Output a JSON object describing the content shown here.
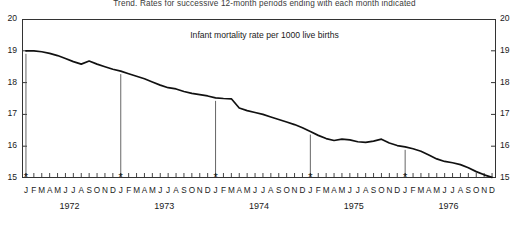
{
  "chart_data": {
    "type": "line",
    "title": "Trend.  Rates for successive 12-month periods ending with each month indicated",
    "subtitle": "Infant mortality rate per 1000 live births",
    "xlabel": "",
    "ylabel": "",
    "ylim": [
      15,
      20
    ],
    "yticks": [
      15,
      16,
      17,
      18,
      19,
      20
    ],
    "ytick_labels": [
      "15",
      "16",
      "17",
      "18",
      "19",
      "20"
    ],
    "right_axis": true,
    "grid": false,
    "legend": null,
    "years": [
      "1972",
      "1973",
      "1974",
      "1975",
      "1976"
    ],
    "month_labels": [
      "J",
      "F",
      "M",
      "A",
      "M",
      "J",
      "J",
      "A",
      "S",
      "O",
      "N",
      "D"
    ],
    "x_tick_labels": [
      "J",
      "F",
      "M",
      "A",
      "M",
      "J",
      "J",
      "A",
      "S",
      "O",
      "N",
      "D",
      "J",
      "F",
      "M",
      "A",
      "M",
      "J",
      "J",
      "A",
      "S",
      "O",
      "N",
      "D",
      "J",
      "F",
      "M",
      "A",
      "M",
      "J",
      "J",
      "A",
      "S",
      "O",
      "N",
      "D",
      "J",
      "F",
      "M",
      "A",
      "M",
      "J",
      "J",
      "A",
      "S",
      "O",
      "N",
      "D",
      "J",
      "F",
      "M",
      "A",
      "M",
      "J",
      "J",
      "A",
      "S",
      "O",
      "N",
      "D"
    ],
    "annotations": [
      {
        "label": "*",
        "x_index": 0,
        "note": "year marker"
      },
      {
        "label": "*",
        "x_index": 12,
        "note": "year marker"
      },
      {
        "label": "*",
        "x_index": 24,
        "note": "year marker"
      },
      {
        "label": "*",
        "x_index": 36,
        "note": "year marker"
      },
      {
        "label": "*",
        "x_index": 48,
        "note": "year marker"
      }
    ],
    "series": [
      {
        "name": "Infant mortality rate per 1000 live births",
        "color": "#111111",
        "x": [
          "1972-J",
          "1972-F",
          "1972-M",
          "1972-A",
          "1972-M",
          "1972-J",
          "1972-J",
          "1972-A",
          "1972-S",
          "1972-O",
          "1972-N",
          "1972-D",
          "1973-J",
          "1973-F",
          "1973-M",
          "1973-A",
          "1973-M",
          "1973-J",
          "1973-J",
          "1973-A",
          "1973-S",
          "1973-O",
          "1973-N",
          "1973-D",
          "1974-J",
          "1974-F",
          "1974-M",
          "1974-A",
          "1974-M",
          "1974-J",
          "1974-J",
          "1974-A",
          "1974-S",
          "1974-O",
          "1974-N",
          "1974-D",
          "1975-J",
          "1975-F",
          "1975-M",
          "1975-A",
          "1975-M",
          "1975-J",
          "1975-J",
          "1975-A",
          "1975-S",
          "1975-O",
          "1975-N",
          "1975-D",
          "1976-J",
          "1976-F",
          "1976-M",
          "1976-A",
          "1976-M",
          "1976-J",
          "1976-J",
          "1976-A",
          "1976-S",
          "1976-O",
          "1976-N",
          "1976-D"
        ],
        "values": [
          19.0,
          19.0,
          18.97,
          18.92,
          18.85,
          18.76,
          18.66,
          18.58,
          18.68,
          18.58,
          18.5,
          18.42,
          18.36,
          18.28,
          18.2,
          18.12,
          18.02,
          17.92,
          17.84,
          17.8,
          17.72,
          17.66,
          17.62,
          17.58,
          17.52,
          17.5,
          17.49,
          17.2,
          17.12,
          17.06,
          17.0,
          16.92,
          16.84,
          16.76,
          16.68,
          16.58,
          16.46,
          16.34,
          16.24,
          16.18,
          16.22,
          16.2,
          16.14,
          16.12,
          16.16,
          16.22,
          16.1,
          16.02,
          15.98,
          15.92,
          15.84,
          15.72,
          15.6,
          15.52,
          15.48,
          15.42,
          15.32,
          15.2,
          15.1,
          15.02
        ]
      }
    ]
  }
}
